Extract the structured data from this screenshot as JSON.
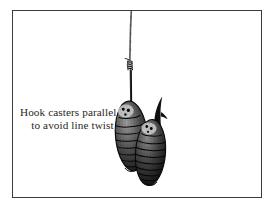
{
  "figure": {
    "name": "hook-casters-parallel-illustration",
    "medium": "pen-and-ink line drawing",
    "background_color": "#ffffff",
    "ink_color": "#1a1a1a",
    "frame": {
      "name": "illustration-border",
      "color": "#3b3b3b",
      "style": "thin rectangular rule box"
    },
    "caption": {
      "line1": "Hook casters parallel",
      "line2": "to avoid line twist",
      "full_text": "Hook casters parallel to avoid line twist",
      "color": "#2a2724",
      "alignment": "centered, two lines, left of the illustration"
    },
    "elements": [
      {
        "name": "fishing-line",
        "label": "fishing line",
        "description": "Thin twisted monofilament line descending from the top border down to the knot"
      },
      {
        "name": "knot-whipping",
        "label": "whipped knot",
        "description": "Coiled wraps binding the line to the hook shank, with a short tag end to the left"
      },
      {
        "name": "hook-shank",
        "label": "hook shank",
        "description": "Straight dark shank running down from the knot into the first caster"
      },
      {
        "name": "hook-point-barb",
        "label": "hook point and barb",
        "description": "Hook bend curving up to a sharp point with barb, emerging above the right caster"
      },
      {
        "name": "caster-left",
        "label": "left caster",
        "description": "Stippled, ring-segmented oval pupa hanging on the hook, slightly higher and left"
      },
      {
        "name": "caster-right",
        "label": "right caster",
        "description": "Second stippled, ring-segmented oval pupa hung parallel alongside the first, slightly lower and right"
      }
    ]
  }
}
